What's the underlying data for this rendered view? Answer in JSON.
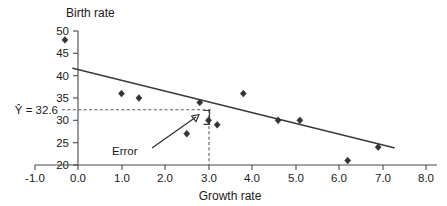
{
  "chart_data": {
    "type": "scatter",
    "title": "",
    "xlabel": "Growth rate",
    "ylabel": "Birth rate",
    "xlim": [
      -1.0,
      8.0
    ],
    "ylim": [
      20,
      50
    ],
    "grid": false,
    "legend": "none",
    "xticks": [
      "-1.0",
      "0.0",
      "1.0",
      "2.0",
      "3.0",
      "4.0",
      "5.0",
      "6.0",
      "7.0",
      "8.0"
    ],
    "xtick_values": [
      -1.0,
      0.0,
      1.0,
      2.0,
      3.0,
      4.0,
      5.0,
      6.0,
      7.0,
      8.0
    ],
    "yticks": [
      "20",
      "25",
      "30",
      "35",
      "40",
      "45",
      "50"
    ],
    "ytick_values": [
      20,
      25,
      30,
      35,
      40,
      45,
      50
    ],
    "points": [
      {
        "x": -0.3,
        "y": 48
      },
      {
        "x": 1.0,
        "y": 36
      },
      {
        "x": 1.4,
        "y": 35
      },
      {
        "x": 2.5,
        "y": 27
      },
      {
        "x": 2.8,
        "y": 34
      },
      {
        "x": 3.0,
        "y": 30
      },
      {
        "x": 3.2,
        "y": 29
      },
      {
        "x": 3.8,
        "y": 36
      },
      {
        "x": 4.6,
        "y": 30
      },
      {
        "x": 5.1,
        "y": 30
      },
      {
        "x": 6.2,
        "y": 21
      },
      {
        "x": 6.9,
        "y": 24
      }
    ],
    "series": [
      {
        "name": "observations",
        "x": [
          -0.3,
          1.0,
          1.4,
          2.5,
          2.8,
          3.0,
          3.2,
          3.8,
          4.6,
          5.1,
          6.2,
          6.9
        ],
        "values": [
          48,
          36,
          35,
          27,
          34,
          30,
          29,
          36,
          30,
          30,
          21,
          24
        ]
      }
    ],
    "fit_line": {
      "name": "regression-line",
      "x_start": -0.12,
      "y_start": 41.1,
      "x_end": 7.2,
      "y_end": 23.3
    },
    "annotations": {
      "predicted_label": "Ŷ = 32.6",
      "predicted_value": 32.6,
      "predicted_x": 3.0,
      "error_label": "Error",
      "error_from_y": 32.6,
      "error_to_y": 30.0
    }
  },
  "axes": {
    "y_axis_title": "Birth rate",
    "x_axis_title": "Growth rate"
  }
}
